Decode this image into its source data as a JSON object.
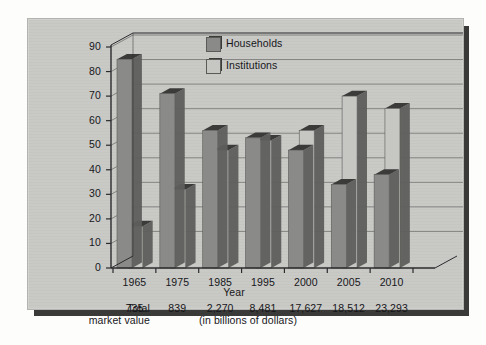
{
  "chart_data": {
    "type": "bar",
    "title": "",
    "xlabel": "Year",
    "ylabel": "",
    "ylim": [
      0,
      90
    ],
    "yticks": [
      0,
      10,
      20,
      30,
      40,
      50,
      60,
      70,
      80,
      90
    ],
    "grid": true,
    "legend_position": "top-center",
    "categories": [
      "1965",
      "1975",
      "1985",
      "1995",
      "2000",
      "2005",
      "2010"
    ],
    "series": [
      {
        "name": "Households",
        "color": "#8a8a88",
        "values": [
          85,
          71,
          56,
          53,
          48,
          34,
          38
        ]
      },
      {
        "name": "Institutions",
        "color": "#c6c6c3",
        "values": [
          17,
          32,
          48,
          52,
          56,
          70,
          65
        ]
      }
    ],
    "annotations": {
      "total_label_line1": "Total",
      "total_label_line2": "market value",
      "totals": [
        "735",
        "839",
        "2,270",
        "8,481",
        "17,627",
        "18,512",
        "23,293"
      ],
      "units_note": "(in billions of dollars)"
    }
  },
  "colors": {
    "panel_background": "#c9c9c6",
    "households": "#8a8a88",
    "institutions": "#c6c6c3",
    "axis": "#2b2b2e",
    "gridline": "#6f6f6e",
    "text": "#17171a"
  }
}
